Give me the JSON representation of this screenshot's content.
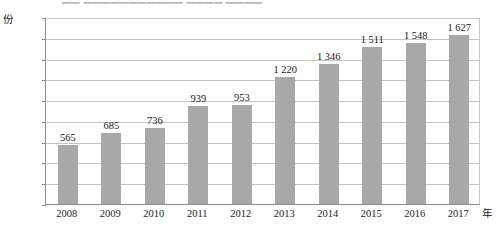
{
  "title_strip": {
    "visible_fragment": "▁▁ ▁▁▁▁▁▁▁▁▁▁▁ ▁▁▁▁ ▁▁▁▁",
    "note_cut_off": true
  },
  "axis": {
    "y_unit": "份",
    "x_unit": "年",
    "y_ticks": [
      "1 800",
      "1 600",
      "1 400",
      "1 200",
      "1 000",
      "800",
      "600",
      "400",
      "200",
      "0"
    ]
  },
  "style": {
    "bar_color": "#a8a8a8",
    "gridline_color": "#c4c4c4",
    "axis_color": "#8d8d8d",
    "background": "#ffffff"
  },
  "chart_data": {
    "type": "bar",
    "title": "",
    "xlabel": "年",
    "ylabel": "份",
    "ylim": [
      0,
      1800
    ],
    "ystep": 200,
    "grid": true,
    "legend": false,
    "categories": [
      "2008",
      "2009",
      "2010",
      "2011",
      "2012",
      "2013",
      "2014",
      "2015",
      "2016",
      "2017"
    ],
    "values": [
      565,
      685,
      736,
      939,
      953,
      1220,
      1346,
      1511,
      1548,
      1627
    ],
    "value_labels": [
      "565",
      "685",
      "736",
      "939",
      "953",
      "1 220",
      "1 346",
      "1 511",
      "1 548",
      "1 627"
    ]
  }
}
